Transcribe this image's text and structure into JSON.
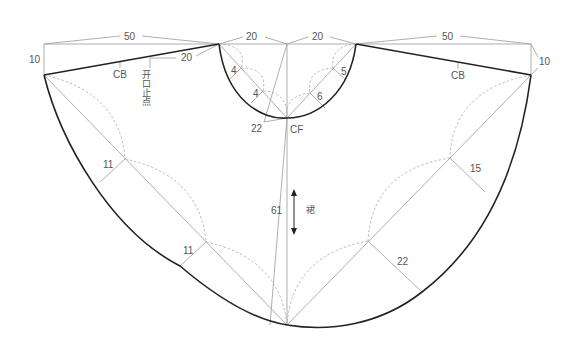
{
  "diagram": {
    "type": "sewing-pattern",
    "colors": {
      "outline": "#222222",
      "construction": "#9a9a9a",
      "label": "#555555"
    },
    "labels": {
      "top_left_width": "50",
      "top_left_neck": "20",
      "top_right_neck": "20",
      "top_right_width": "50",
      "left_drop": "10",
      "right_drop": "10",
      "left_cb": "CB",
      "right_cb": "CB",
      "opening_offset": "20",
      "opening_stop": "开口止点",
      "neck_left_outer": "4",
      "neck_left_inner": "4",
      "neck_right_outer": "5",
      "neck_right_inner": "6",
      "neck_depth": "22",
      "cf": "CF",
      "center_length": "61",
      "grain_label": "裙",
      "left_upper_offset": "11",
      "left_lower_offset": "11",
      "right_upper_offset": "15",
      "right_lower_offset": "22"
    }
  }
}
